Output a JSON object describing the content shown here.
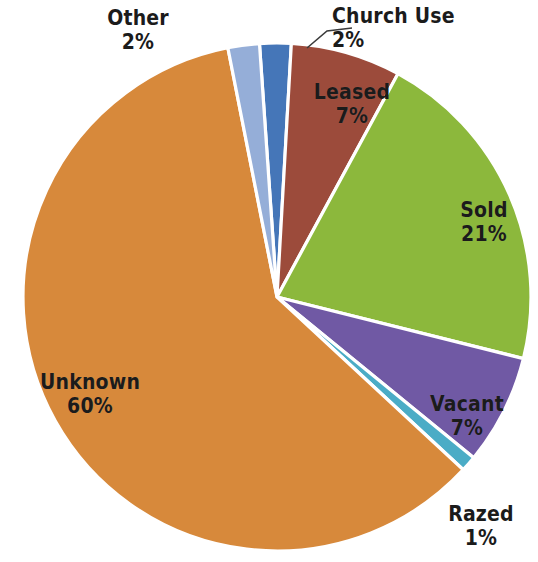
{
  "chart_data": {
    "type": "pie",
    "title": "",
    "subtitle": "",
    "xlabel": "",
    "ylabel": "",
    "legend_position": "none",
    "grid": false,
    "labels_on_slices": true,
    "value_format": "percent",
    "total_percent": 100,
    "categories": [
      "Church Use",
      "Leased",
      "Sold",
      "Vacant",
      "Razed",
      "Unknown",
      "Other"
    ],
    "values": [
      2,
      7,
      21,
      7,
      1,
      60,
      2
    ],
    "slices": [
      {
        "label": "Church Use",
        "value": 2,
        "display_value": "2%",
        "color": "#4576b8",
        "label_placement": "outside-leader"
      },
      {
        "label": "Leased",
        "value": 7,
        "display_value": "7%",
        "color": "#9c4b3b",
        "label_placement": "inside"
      },
      {
        "label": "Sold",
        "value": 21,
        "display_value": "21%",
        "color": "#8cb83c",
        "label_placement": "inside"
      },
      {
        "label": "Vacant",
        "value": 7,
        "display_value": "7%",
        "color": "#7059a4",
        "label_placement": "inside"
      },
      {
        "label": "Razed",
        "value": 1,
        "display_value": "1%",
        "color": "#4bacc6",
        "label_placement": "outside"
      },
      {
        "label": "Unknown",
        "value": 60,
        "display_value": "60%",
        "color": "#d7893b",
        "label_placement": "inside"
      },
      {
        "label": "Other",
        "value": 2,
        "display_value": "2%",
        "color": "#95aed8",
        "label_placement": "outside"
      }
    ],
    "colors": {
      "church_use": "#4576b8",
      "leased": "#9c4b3b",
      "sold": "#8cb83c",
      "vacant": "#7059a4",
      "razed": "#4bacc6",
      "unknown": "#d7893b",
      "other": "#95aed8",
      "slice_border": "#ffffff",
      "background": "#ffffff",
      "label_text": "#1b1b1b",
      "leader_line": "#3b3b3b"
    }
  }
}
